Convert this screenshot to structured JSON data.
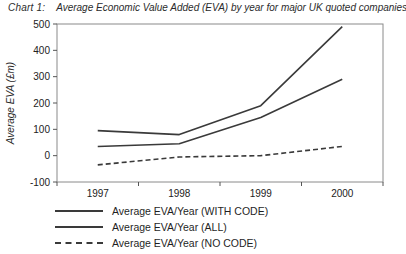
{
  "title": {
    "prefix": "Chart 1:",
    "text": "Average Economic Value Added (EVA) by year for major UK quoted companies"
  },
  "chart_data": {
    "type": "line",
    "categories": [
      "1997",
      "1998",
      "1999",
      "2000"
    ],
    "series": [
      {
        "name": "Average EVA/Year (WITH CODE)",
        "style": "solid",
        "values": [
          95,
          80,
          190,
          490
        ]
      },
      {
        "name": "Average EVA/Year (ALL)",
        "style": "solid",
        "values": [
          35,
          45,
          145,
          290
        ]
      },
      {
        "name": "Average EVA/Year (NO CODE)",
        "style": "dashed",
        "values": [
          -35,
          -5,
          0,
          35
        ]
      }
    ],
    "xlabel": "",
    "ylabel": "Average EVA (£m)",
    "ylim": [
      -100,
      500
    ],
    "yticks": [
      500,
      400,
      300,
      200,
      100,
      0,
      -100
    ],
    "grid": false,
    "legend_position": "bottom-left",
    "line_color": "#3a3a3a",
    "axis_color": "#8a8a8a"
  }
}
